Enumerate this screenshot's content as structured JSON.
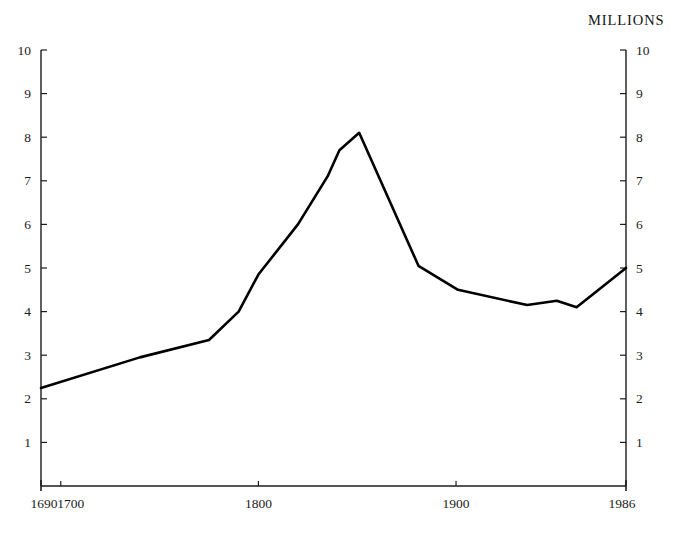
{
  "chart_data": {
    "type": "line",
    "title": "",
    "subtitle": "",
    "unit_label": "MILLIONS",
    "xlabel": "",
    "ylabel": "",
    "xlim": [
      1690,
      1986
    ],
    "ylim": [
      0,
      10
    ],
    "grid": false,
    "legend": false,
    "y_ticks_left": [
      "1",
      "2",
      "3",
      "4",
      "5",
      "6",
      "7",
      "8",
      "9",
      "10"
    ],
    "y_ticks_right": [
      "1",
      "2",
      "3",
      "4",
      "5",
      "6",
      "7",
      "8",
      "9",
      "10"
    ],
    "y_tick_values": [
      1,
      2,
      3,
      4,
      5,
      6,
      7,
      8,
      9,
      10
    ],
    "x_ticks": [
      {
        "label": "1690",
        "value": 1690
      },
      {
        "label": "1700",
        "value": 1700
      },
      {
        "label": "1800",
        "value": 1800
      },
      {
        "label": "1900",
        "value": 1900
      },
      {
        "label": "1986",
        "value": 1986
      }
    ],
    "series": [
      {
        "name": "Population",
        "color": "#000000",
        "x": [
          1690,
          1740,
          1775,
          1790,
          1800,
          1820,
          1835,
          1841,
          1851,
          1881,
          1901,
          1936,
          1951,
          1961,
          1986
        ],
        "values": [
          2.25,
          2.95,
          3.35,
          4.0,
          4.85,
          6.0,
          7.1,
          7.7,
          8.1,
          5.05,
          4.5,
          4.15,
          4.25,
          4.1,
          5.0
        ]
      }
    ],
    "annotations": []
  },
  "axis": {
    "left_axis_name": "left-value-axis",
    "right_axis_name": "right-value-axis",
    "bottom_axis_name": "year-axis"
  }
}
